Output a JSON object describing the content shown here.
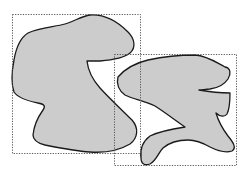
{
  "diagram": {
    "colors": {
      "background": "#ffffff",
      "blob_fill": "#cccccc",
      "blob_stroke": "#1a1a1a",
      "box_stroke": "#555555"
    },
    "shapes": [
      {
        "id": "left-blob",
        "bounding_box": {
          "x": 12,
          "y": 14,
          "width": 128,
          "height": 139
        },
        "path": "M 90 15 C 105 14, 118 22, 128 32 C 135 39, 136 48, 130 53 C 124 58, 112 60, 100 61 C 94 61, 89 61, 87 61 C 88 70, 92 79, 100 88 C 110 99, 122 110, 132 120 C 139 128, 138 138, 130 144 C 120 150, 105 153, 90 152 C 75 151, 60 148, 45 145 C 37 143, 33 140, 33 135 C 34 125, 38 117, 43 110 C 46 106, 44 104, 38 103 C 28 101, 18 98, 14 92 C 11 83, 12 70, 14 60 C 16 48, 20 38, 28 33 C 40 27, 55 27, 65 24 C 75 21, 82 16, 90 15 Z"
      },
      {
        "id": "right-blob",
        "bounding_box": {
          "x": 114,
          "y": 54,
          "width": 122,
          "height": 111
        },
        "path": "M 118 77 C 124 70, 135 63, 148 60 C 162 57, 178 55, 195 55 C 208 56, 217 63, 225 67 C 231 68, 231 74, 228 79 C 224 85, 218 88, 210 89 C 206 89, 202 90, 199 90 C 210 92, 222 93, 230 93 C 230 100, 230 108, 227 114 C 225 117, 220 117, 216 113 C 218 120, 222 128, 228 136 C 233 142, 237 148, 232 151 C 226 153, 218 151, 210 147 C 203 143, 197 140, 188 140 C 178 140, 170 142, 163 148 C 158 153, 157 160, 150 164 C 145 166, 141 164, 141 158 C 140 150, 142 142, 150 136 C 160 131, 172 129, 185 127 C 176 121, 166 113, 155 106 C 145 101, 133 99, 125 95 C 119 91, 116 84, 118 77 Z"
      }
    ]
  }
}
